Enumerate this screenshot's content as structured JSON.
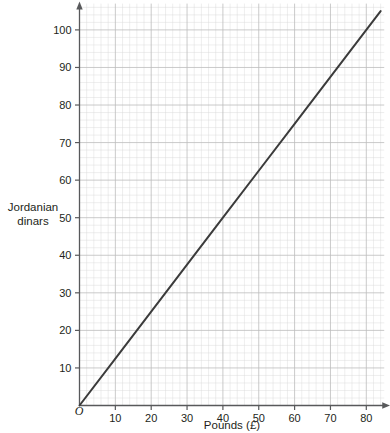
{
  "chart_data": {
    "type": "line",
    "title": "",
    "xlabel": "Pounds (£)",
    "ylabel": "Jordanian dinars",
    "ylabel_lines": [
      "Jordanian",
      "dinars"
    ],
    "origin_label": "O",
    "xlim": [
      0,
      85
    ],
    "ylim": [
      0,
      107
    ],
    "xticks": [
      10,
      20,
      30,
      40,
      50,
      60,
      70,
      80
    ],
    "xtick_labels": [
      "10",
      "20",
      "30",
      "40",
      "50",
      "60",
      "70",
      "80"
    ],
    "yticks": [
      10,
      20,
      30,
      40,
      50,
      60,
      70,
      80,
      90,
      100
    ],
    "ytick_labels": [
      "10",
      "20",
      "30",
      "40",
      "50",
      "60",
      "70",
      "80",
      "90",
      "100"
    ],
    "x_major_step": 10,
    "x_minor_step": 2,
    "y_major_step": 10,
    "y_minor_step": 2,
    "grid": true,
    "legend": "none",
    "series": [
      {
        "name": "Pounds to Jordanian dinars conversion",
        "rate": 1.25,
        "x": [
          0,
          84
        ],
        "values": [
          0,
          105
        ],
        "points": [
          {
            "x": 0,
            "y": 0
          },
          {
            "x": 10,
            "y": 12.5
          },
          {
            "x": 20,
            "y": 25
          },
          {
            "x": 30,
            "y": 37.5
          },
          {
            "x": 40,
            "y": 50
          },
          {
            "x": 50,
            "y": 62.5
          },
          {
            "x": 60,
            "y": 75
          },
          {
            "x": 70,
            "y": 87.5
          },
          {
            "x": 80,
            "y": 100
          },
          {
            "x": 84,
            "y": 105
          }
        ]
      }
    ],
    "colors": {
      "line": "#3b3b3b",
      "axis": "#58595b",
      "grid_major": "#bdbdbd",
      "grid_minor": "#d9d9d9",
      "background": "#ffffff",
      "text": "#231f20"
    }
  }
}
